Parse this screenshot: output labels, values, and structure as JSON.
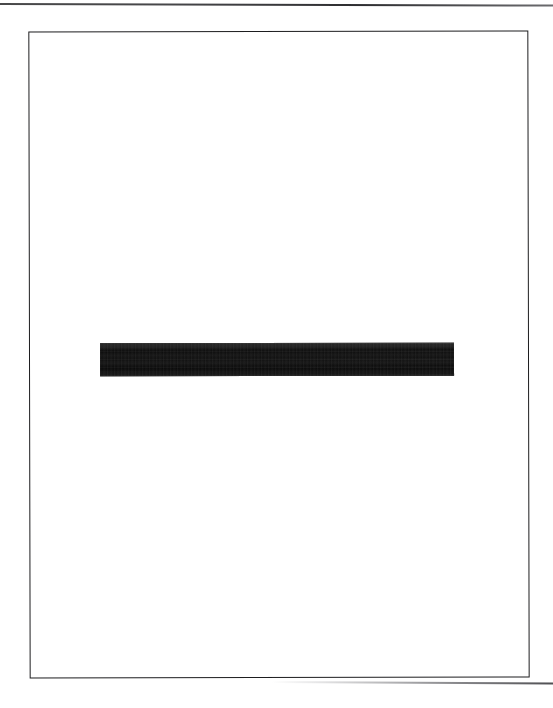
{
  "document": {
    "type": "scanned-document-page",
    "page_background_color": "#ffffff",
    "frame": {
      "name": "page-border-frame",
      "border_color": "#1d1d1f",
      "border_width_px": 2,
      "x": 30,
      "y": 32,
      "width": 500,
      "height": 647,
      "rotation_deg": -0.12
    },
    "scan_artifacts": [
      {
        "name": "top-scan-edge-line",
        "color": "#2a2a2c",
        "x": 0,
        "y": 3,
        "width": 553,
        "height": 2,
        "rotation_deg": 0.16
      },
      {
        "name": "bottom-scan-edge-line",
        "color": "#3c3c40",
        "x": 272,
        "y": 681,
        "width": 281,
        "height": 2,
        "rotation_deg": 0.3
      }
    ],
    "marks": [
      {
        "name": "redaction-bar",
        "kind": "solid-black-bar",
        "color": "#151515",
        "x": 100,
        "y": 343,
        "width": 354,
        "height": 33,
        "description": "Solid black horizontal redaction bar centered on the page"
      }
    ],
    "text_content": [],
    "page_size": {
      "width": 553,
      "height": 708
    }
  }
}
